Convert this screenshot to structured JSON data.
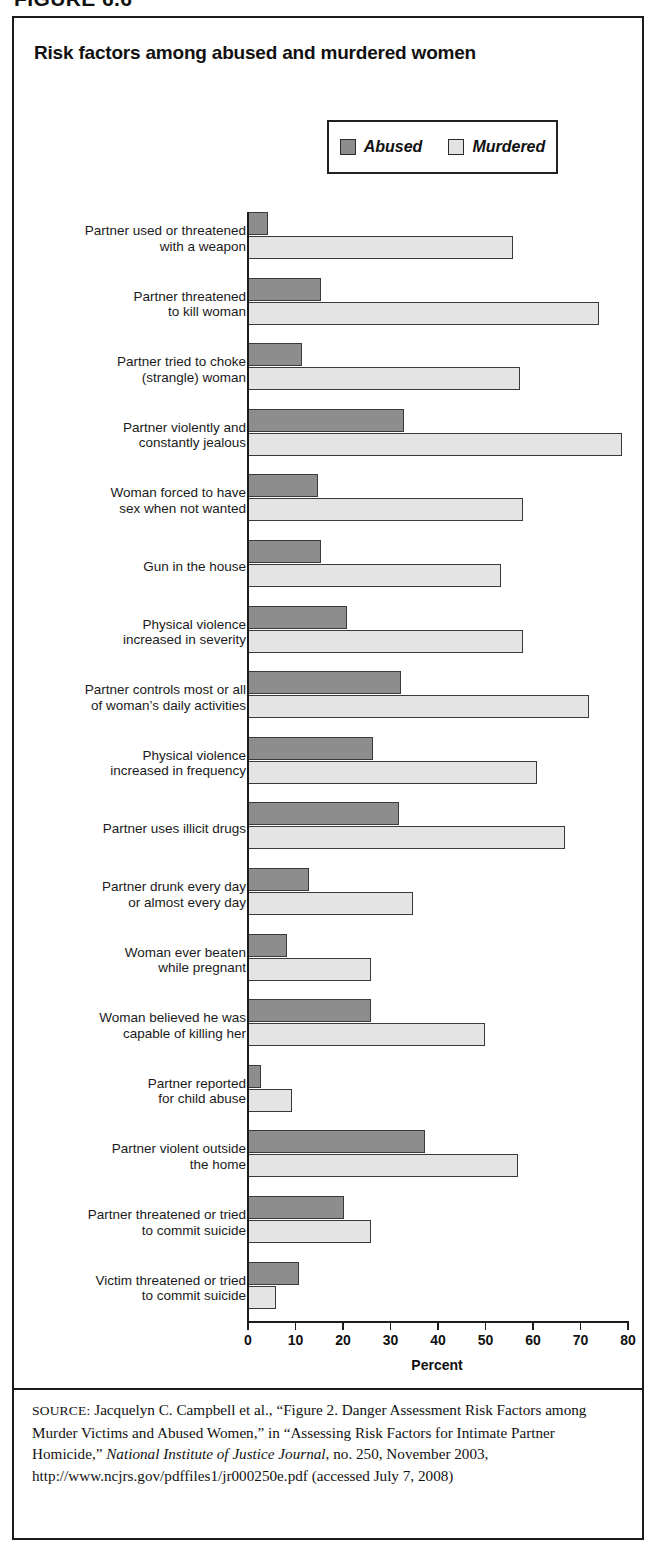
{
  "figure": {
    "number": "FIGURE 6.6"
  },
  "chart": {
    "title": "Risk factors among abused and murdered women",
    "axis_title": "Percent",
    "legend": [
      {
        "key": "abused",
        "label": "Abused",
        "color": "#8d8d8d"
      },
      {
        "key": "murdered",
        "label": "Murdered",
        "color": "#e4e4e4"
      }
    ]
  },
  "source": {
    "label": "SOURCE:",
    "text_1": " Jacquelyn C. Campbell et al., “Figure 2. Danger Assessment Risk Factors among Murder Victims and Abused Women,” in “Assessing Risk Factors for Intimate Partner Homicide,” ",
    "italic_1": "National Institute of Justice Journal",
    "text_2": ", no. 250, November 2003, http://www.ncjrs.gov/pdffiles1/jr000250e.pdf (accessed July 7, 2008)"
  },
  "chart_data": {
    "type": "bar",
    "orientation": "horizontal",
    "title": "Risk factors among abused and murdered women",
    "xlabel": "Percent",
    "ylabel": "",
    "xlim": [
      0,
      80
    ],
    "xticks": [
      0,
      10,
      20,
      30,
      40,
      50,
      60,
      70,
      80
    ],
    "grid": false,
    "legend_position": "top-right",
    "categories": [
      "Partner used or threatened\nwith a weapon",
      "Partner threatened\nto kill woman",
      "Partner tried to choke\n(strangle) woman",
      "Partner violently and\nconstantly jealous",
      "Woman forced to have\nsex when not wanted",
      "Gun in the house",
      "Physical violence\nincreased in severity",
      "Partner controls most or all\nof woman’s daily activities",
      "Physical violence\nincreased in frequency",
      "Partner uses illicit drugs",
      "Partner drunk every day\nor almost every day",
      "Woman ever beaten\nwhile pregnant",
      "Woman believed he was\ncapable of killing her",
      "Partner reported\nfor child abuse",
      "Partner violent outside\nthe home",
      "Partner threatened or tried\nto commit suicide",
      "Victim threatened or tried\nto commit suicide"
    ],
    "series": [
      {
        "name": "Abused",
        "color": "#8d8d8d",
        "values": [
          4.5,
          15.5,
          11.5,
          33,
          15,
          15.5,
          21,
          32.5,
          26.5,
          32,
          13,
          8.5,
          26,
          3,
          37.5,
          20.5,
          11
        ]
      },
      {
        "name": "Murdered",
        "color": "#e4e4e4",
        "values": [
          56,
          74,
          57.5,
          79,
          58,
          53.5,
          58,
          72,
          61,
          67,
          35,
          26,
          50,
          9.5,
          57,
          26,
          6
        ]
      }
    ]
  }
}
